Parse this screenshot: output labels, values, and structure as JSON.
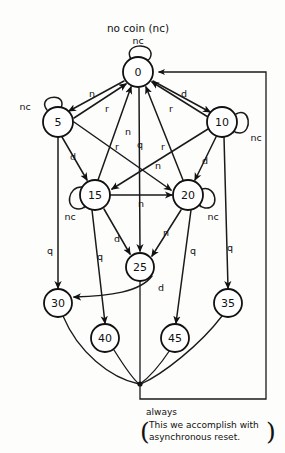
{
  "diagram": {
    "title": "no coin (nc)",
    "note_line1": "always",
    "note_line2": "This we accomplish with",
    "note_line3": "asynchronous reset.",
    "paren_open": "(",
    "paren_close": ")",
    "stroke_color": "#111111",
    "background_color": "#fdfdfc",
    "states": [
      {
        "id": "s0",
        "label": "0",
        "cx": 138,
        "cy": 72,
        "r": 15
      },
      {
        "id": "s5",
        "label": "5",
        "cx": 58,
        "cy": 122,
        "r": 15
      },
      {
        "id": "s10",
        "label": "10",
        "cx": 222,
        "cy": 122,
        "r": 15
      },
      {
        "id": "s15",
        "label": "15",
        "cx": 95,
        "cy": 195,
        "r": 15
      },
      {
        "id": "s20",
        "label": "20",
        "cx": 188,
        "cy": 195,
        "r": 15
      },
      {
        "id": "s25",
        "label": "25",
        "cx": 140,
        "cy": 267,
        "r": 14
      },
      {
        "id": "s30",
        "label": "30",
        "cx": 58,
        "cy": 303,
        "r": 14
      },
      {
        "id": "s35",
        "label": "35",
        "cx": 228,
        "cy": 303,
        "r": 14
      },
      {
        "id": "s40",
        "label": "40",
        "cx": 105,
        "cy": 338,
        "r": 14
      },
      {
        "id": "s45",
        "label": "45",
        "cx": 175,
        "cy": 338,
        "r": 14
      }
    ],
    "edge_labels": [
      {
        "id": "lbl-nc-0",
        "text": "nc",
        "x": 138,
        "y": 40
      },
      {
        "id": "lbl-nc-5",
        "text": "nc",
        "x": 25,
        "y": 106
      },
      {
        "id": "lbl-nc-10",
        "text": "nc",
        "x": 256,
        "y": 137
      },
      {
        "id": "lbl-nc-15",
        "text": "nc",
        "x": 70,
        "y": 216
      },
      {
        "id": "lbl-nc-20",
        "text": "nc",
        "x": 213,
        "y": 216
      },
      {
        "id": "lbl-0-5-n",
        "text": "n",
        "x": 92,
        "y": 93
      },
      {
        "id": "lbl-5-0-r",
        "text": "r",
        "x": 107,
        "y": 108
      },
      {
        "id": "lbl-0-10-d",
        "text": "d",
        "x": 184,
        "y": 93
      },
      {
        "id": "lbl-10-0-r",
        "text": "r",
        "x": 171,
        "y": 108
      },
      {
        "id": "lbl-5-20-n",
        "text": "n",
        "x": 128,
        "y": 131
      },
      {
        "id": "lbl-15-0-r",
        "text": "r",
        "x": 117,
        "y": 146
      },
      {
        "id": "lbl-0-25-q",
        "text": "q",
        "x": 140,
        "y": 144
      },
      {
        "id": "lbl-20-0-r",
        "text": "r",
        "x": 163,
        "y": 146
      },
      {
        "id": "lbl-10-15-n",
        "text": "n",
        "x": 158,
        "y": 165
      },
      {
        "id": "lbl-5-15-d",
        "text": "d",
        "x": 73,
        "y": 156
      },
      {
        "id": "lbl-10-20-d",
        "text": "d",
        "x": 205,
        "y": 160
      },
      {
        "id": "lbl-15-20-n",
        "text": "n",
        "x": 141,
        "y": 203
      },
      {
        "id": "lbl-15-25-d",
        "text": "d",
        "x": 117,
        "y": 238
      },
      {
        "id": "lbl-20-25-n",
        "text": "n",
        "x": 166,
        "y": 232
      },
      {
        "id": "lbl-5-30-q",
        "text": "q",
        "x": 50,
        "y": 250
      },
      {
        "id": "lbl-15-40-q",
        "text": "q",
        "x": 100,
        "y": 256
      },
      {
        "id": "lbl-20-45-q",
        "text": "q",
        "x": 193,
        "y": 250
      },
      {
        "id": "lbl-20-35-q",
        "text": "q",
        "x": 230,
        "y": 247
      },
      {
        "id": "lbl-25-30-d",
        "text": "d",
        "x": 161,
        "y": 287
      }
    ]
  }
}
